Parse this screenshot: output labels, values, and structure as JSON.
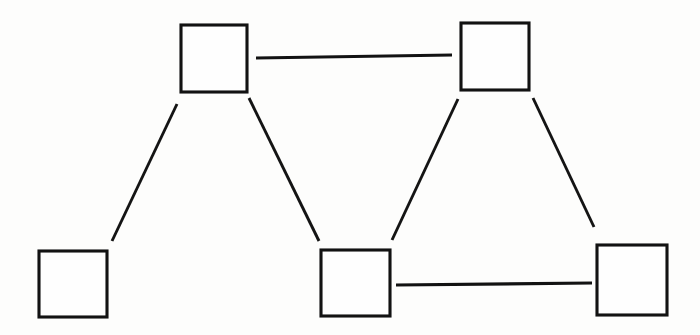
{
  "figure": {
    "kind": "node-link-diagram",
    "background_color": "#fdfdfc",
    "ink_color": "#121212",
    "width": 700,
    "height": 335,
    "node_label": "",
    "node_count": 5,
    "edge_count": 5
  },
  "nodes": [
    {
      "id": "node-top-left",
      "name": "top-left-node",
      "label": "",
      "x": 181,
      "y": 25,
      "width": 66,
      "height": 67
    },
    {
      "id": "node-top-right",
      "name": "top-right-node",
      "label": "",
      "x": 461,
      "y": 23,
      "width": 68,
      "height": 67
    },
    {
      "id": "node-bottom-left",
      "name": "bottom-left-node",
      "label": "",
      "x": 39,
      "y": 251,
      "width": 68,
      "height": 66
    },
    {
      "id": "node-bottom-middle",
      "name": "bottom-middle-node",
      "label": "",
      "x": 321,
      "y": 250,
      "width": 69,
      "height": 66
    },
    {
      "id": "node-bottom-right",
      "name": "bottom-right-node",
      "label": "",
      "x": 597,
      "y": 245,
      "width": 70,
      "height": 70
    }
  ],
  "edges": [
    {
      "id": "edge-top-horizontal",
      "name": "edge-top-left-to-top-right",
      "from": "node-top-left",
      "to": "node-top-right",
      "label": "",
      "x1": 256,
      "y1": 58,
      "x2": 452,
      "y2": 55,
      "orientation": "horizontal"
    },
    {
      "id": "edge-bottom-horizontal",
      "name": "edge-bottom-middle-to-bottom-right",
      "from": "node-bottom-middle",
      "to": "node-bottom-right",
      "label": "",
      "x1": 396,
      "y1": 285,
      "x2": 592,
      "y2": 283,
      "orientation": "horizontal"
    },
    {
      "id": "edge-left-diagonal",
      "name": "edge-top-left-to-bottom-left",
      "from": "node-top-left",
      "to": "node-bottom-left",
      "label": "",
      "x1": 177,
      "y1": 104,
      "x2": 112,
      "y2": 241,
      "orientation": "diagonal"
    },
    {
      "id": "edge-center-left-diagonal",
      "name": "edge-top-left-to-bottom-middle",
      "from": "node-top-left",
      "to": "node-bottom-middle",
      "label": "",
      "x1": 249,
      "y1": 98,
      "x2": 319,
      "y2": 241,
      "orientation": "diagonal"
    },
    {
      "id": "edge-center-right-diagonal",
      "name": "edge-top-right-to-bottom-middle",
      "from": "node-top-right",
      "to": "node-bottom-middle",
      "label": "",
      "x1": 458,
      "y1": 99,
      "x2": 392,
      "y2": 240,
      "orientation": "diagonal"
    },
    {
      "id": "edge-right-diagonal",
      "name": "edge-top-right-to-bottom-right",
      "from": "node-top-right",
      "to": "node-bottom-right",
      "label": "",
      "x1": 533,
      "y1": 98,
      "x2": 594,
      "y2": 227,
      "orientation": "diagonal"
    }
  ]
}
